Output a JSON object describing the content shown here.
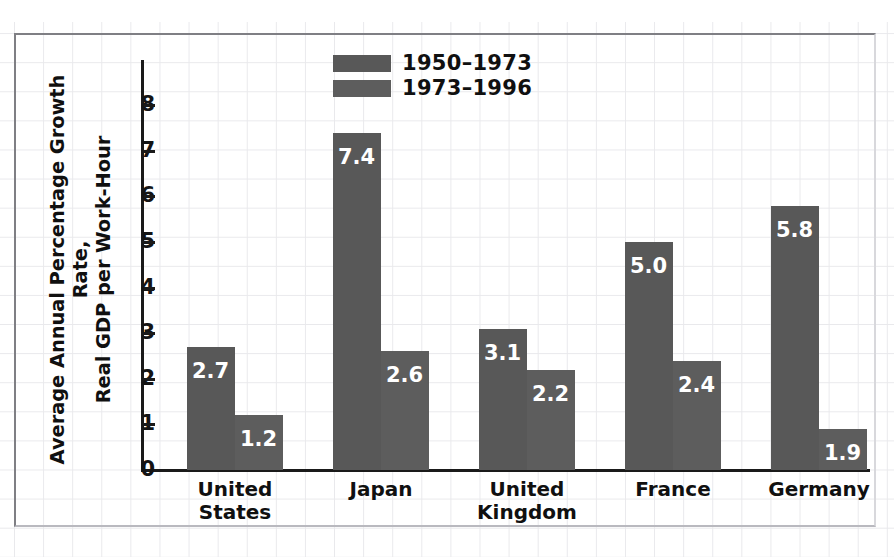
{
  "chart_data": {
    "type": "bar",
    "title": "",
    "xlabel": "",
    "ylabel": "Average Annual Percentage Growth Rate, Real GDP per Work-Hour",
    "ylabel_line1": "Average Annual Percentage Growth Rate,",
    "ylabel_line2": "Real GDP per Work-Hour",
    "ylim": [
      0,
      8.6
    ],
    "yticks": [
      "0",
      "1",
      "2",
      "3",
      "4",
      "5",
      "6",
      "7",
      "8"
    ],
    "grid": true,
    "grid_style": "graph-paper",
    "legend_position": "top-center",
    "categories": [
      "United States",
      "Japan",
      "United Kingdom",
      "France",
      "Germany"
    ],
    "category_lines": [
      [
        "United",
        "States"
      ],
      [
        "Japan",
        ""
      ],
      [
        "United",
        "Kingdom"
      ],
      [
        "France",
        ""
      ],
      [
        "Germany",
        ""
      ]
    ],
    "series": [
      {
        "name": "1950–1973",
        "color": "#585858",
        "values": [
          2.7,
          7.4,
          3.1,
          5.0,
          5.8
        ],
        "labels": [
          "2.7",
          "7.4",
          "3.1",
          "5.0",
          "5.8"
        ]
      },
      {
        "name": "1973–1996",
        "color": "#5d5d5d",
        "values": [
          1.2,
          2.6,
          2.2,
          2.4,
          0.9
        ],
        "labels": [
          "1.2",
          "2.6",
          "2.2",
          "2.4",
          "1.9"
        ]
      }
    ]
  },
  "colors": {
    "bar_series_a": "#585858",
    "bar_series_b": "#5d5d5d",
    "axis": "#1a1a1a",
    "text": "#101010",
    "value_label": "#ffffff",
    "grid_line": "#e9e9ec",
    "frame_border": "#7f7f84",
    "background": "#ffffff"
  }
}
